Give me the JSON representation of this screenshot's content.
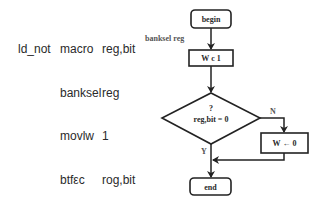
{
  "code": {
    "labels": [
      "ld_not",
      "",
      "",
      "",
      "",
      ""
    ],
    "mnemonics": [
      "macro",
      "banksel",
      "movlw",
      "btfεc",
      "movlw",
      "endm"
    ],
    "operands": [
      "reg,bit",
      "reg",
      "1",
      "rog,bit",
      "0",
      ""
    ]
  },
  "flowchart": {
    "begin": "begin",
    "banksel_label": "banksel reg",
    "assign1": "W c 1",
    "decision_line1": "?",
    "decision_line2": "reg,bit = 0",
    "no_label": "N",
    "yes_label": "Y",
    "assign0": "W ← 0",
    "end": "end"
  }
}
